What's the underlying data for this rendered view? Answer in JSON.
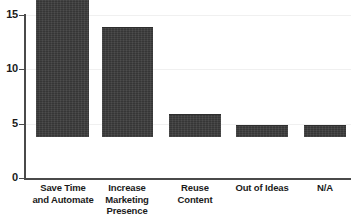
{
  "chart_data": {
    "type": "bar",
    "title": "",
    "subtitle": "",
    "xlabel": "",
    "ylabel": "",
    "ylim": [
      0,
      15
    ],
    "yticks": [
      0,
      5,
      10,
      15
    ],
    "ytick_labels": [
      "0",
      "5",
      "10",
      "15"
    ],
    "grid": "horizontal-faint",
    "legend": "none",
    "categories": [
      "Save Time and Automate",
      "Increase Marketing Presence",
      "Reuse Content",
      "Out of Ideas",
      "N/A"
    ],
    "category_lines": [
      [
        "Save Time",
        "and Automate"
      ],
      [
        "Increase",
        "Marketing",
        "Presence"
      ],
      [
        "Reuse",
        "Content"
      ],
      [
        "Out of Ideas"
      ],
      [
        "N/A"
      ]
    ],
    "values": [
      14,
      10,
      2,
      1,
      1
    ],
    "series": [
      {
        "name": "Responses",
        "values": [
          14,
          10,
          2,
          1,
          1
        ]
      }
    ],
    "bar_color": "#3b3b3b",
    "axis_color": "#4a4a4a",
    "gridline_color": "#f0f0f0",
    "background_color": "#ffffff",
    "text_color": "#1b1b1b"
  }
}
